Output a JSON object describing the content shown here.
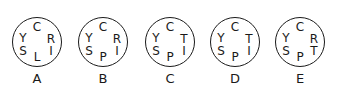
{
  "options": [
    {
      "label": "A",
      "top": "C",
      "upper_left": "Y",
      "lower_left": "S",
      "bottom": "L",
      "upper_right": "R",
      "lower_right": "I"
    },
    {
      "label": "B",
      "top": "C",
      "upper_left": "Y",
      "lower_left": "S",
      "bottom": "P",
      "upper_right": "R",
      "lower_right": "I"
    },
    {
      "label": "C",
      "top": "C",
      "upper_left": "Y",
      "lower_left": "S",
      "bottom": "P",
      "upper_right": "T",
      "lower_right": "I"
    },
    {
      "label": "D",
      "top": "C",
      "upper_left": "Y",
      "lower_left": "S",
      "bottom": "P",
      "upper_right": "T",
      "lower_right": "I"
    },
    {
      "label": "E",
      "top": "C",
      "upper_left": "Y",
      "lower_left": "S",
      "bottom": "P",
      "upper_right": "R",
      "lower_right": "T"
    }
  ],
  "colors": {
    "stroke": "#1a1a1a",
    "background": "#ffffff"
  }
}
